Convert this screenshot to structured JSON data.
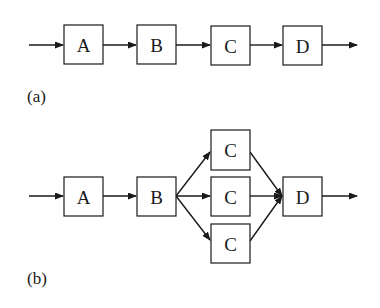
{
  "diagram_a": {
    "caption": "(a)",
    "nodes": [
      {
        "id": "A",
        "label": "A"
      },
      {
        "id": "B",
        "label": "B"
      },
      {
        "id": "C",
        "label": "C"
      },
      {
        "id": "D",
        "label": "D"
      }
    ],
    "edges": [
      [
        "in",
        "A"
      ],
      [
        "A",
        "B"
      ],
      [
        "B",
        "C"
      ],
      [
        "C",
        "D"
      ],
      [
        "D",
        "out"
      ]
    ]
  },
  "diagram_b": {
    "caption": "(b)",
    "nodes": [
      {
        "id": "A",
        "label": "A"
      },
      {
        "id": "B",
        "label": "B"
      },
      {
        "id": "C1",
        "label": "C"
      },
      {
        "id": "C2",
        "label": "C"
      },
      {
        "id": "C3",
        "label": "C"
      },
      {
        "id": "D",
        "label": "D"
      }
    ],
    "edges": [
      [
        "in",
        "A"
      ],
      [
        "A",
        "B"
      ],
      [
        "B",
        "C1"
      ],
      [
        "B",
        "C2"
      ],
      [
        "B",
        "C3"
      ],
      [
        "C1",
        "D"
      ],
      [
        "C2",
        "D"
      ],
      [
        "C3",
        "D"
      ],
      [
        "D",
        "out"
      ]
    ]
  },
  "colors": {
    "stroke": "#1a1a1a",
    "background": "#ffffff"
  }
}
